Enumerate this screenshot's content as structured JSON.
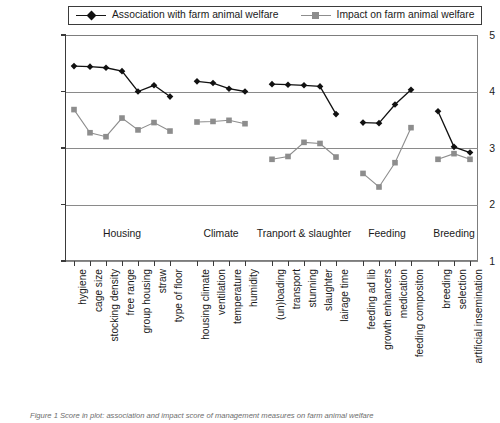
{
  "figure": {
    "caption": "Figure 1 Score in plot: association and impact score of management measures on farm animal welfare"
  },
  "legend": {
    "position": "top",
    "entries": [
      {
        "label": "Association with farm animal welfare",
        "marker": "diamond",
        "color": "#111111",
        "icon": "line-diamond-marker-icon"
      },
      {
        "label": "Impact on farm animal welfare",
        "marker": "square",
        "color": "#8d8d8d",
        "icon": "line-square-marker-icon"
      }
    ]
  },
  "axes": {
    "y": {
      "min": 1,
      "max": 5,
      "ticks": [
        "5",
        "4",
        "3",
        "2",
        "1"
      ],
      "tick_values": [
        5,
        4,
        3,
        2,
        1
      ],
      "label": ""
    },
    "x": {
      "label": ""
    }
  },
  "groups": [
    {
      "name": "Housing",
      "start_index": 0,
      "end_index": 6
    },
    {
      "name": "Climate",
      "start_index": 7,
      "end_index": 10
    },
    {
      "name": "Tranport & slaughter",
      "start_index": 11,
      "end_index": 15
    },
    {
      "name": "Feeding",
      "start_index": 16,
      "end_index": 19
    },
    {
      "name": "Breeding",
      "start_index": 20,
      "end_index": 22
    }
  ],
  "chart_data": {
    "type": "line",
    "title": "",
    "xlabel": "",
    "ylabel": "",
    "ylim": [
      1,
      5
    ],
    "grid": true,
    "legend_position": "top",
    "categories": [
      "hygiene",
      "cage size",
      "stocking density",
      "free range",
      "group housing",
      "straw",
      "type of floor",
      "housing climate",
      "ventilation",
      "temperature",
      "humidity",
      "(un)loading",
      "transport",
      "stunning",
      "slaughter",
      "lairage time",
      "feeding ad lib",
      "growth enhancers",
      "medication",
      "feeding compositon",
      "breeding",
      "selection",
      "artificial insemination"
    ],
    "series": [
      {
        "name": "Association with farm animal welfare",
        "color": "#111111",
        "marker": "diamond",
        "values": [
          4.45,
          4.44,
          4.42,
          4.36,
          4.0,
          4.11,
          3.91,
          4.18,
          4.15,
          4.05,
          4.0,
          4.13,
          4.12,
          4.11,
          4.09,
          3.6,
          3.45,
          3.44,
          3.77,
          4.03,
          3.65,
          3.02,
          2.92
        ]
      },
      {
        "name": "Impact on farm animal welfare",
        "color": "#8d8d8d",
        "marker": "square",
        "values": [
          3.68,
          3.27,
          3.2,
          3.53,
          3.32,
          3.45,
          3.3,
          3.46,
          3.47,
          3.49,
          3.43,
          2.8,
          2.85,
          3.1,
          3.08,
          2.84,
          2.55,
          2.31,
          2.74,
          3.36,
          2.8,
          2.9,
          2.8
        ]
      }
    ]
  }
}
